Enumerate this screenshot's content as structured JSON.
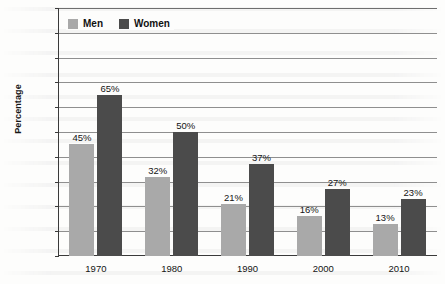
{
  "chart_data": {
    "type": "bar",
    "title": "",
    "xlabel": "",
    "ylabel": "Percentage",
    "ylim": [
      0,
      100
    ],
    "ytick_labels": [
      "100%",
      "90%",
      "80%",
      "70%",
      "60%",
      "50%",
      "40%",
      "30%",
      "20%",
      "10%",
      "0%"
    ],
    "ytick_values": [
      100,
      90,
      80,
      70,
      60,
      50,
      40,
      30,
      20,
      10,
      0
    ],
    "grid": true,
    "legend_position": "top-left-inside",
    "categories": [
      "1970",
      "1980",
      "1990",
      "2000",
      "2010"
    ],
    "series": [
      {
        "name": "Men",
        "color": "#a9a9a9",
        "values": [
          45,
          32,
          21,
          16,
          13
        ],
        "labels": [
          "45%",
          "32%",
          "21%",
          "16%",
          "13%"
        ]
      },
      {
        "name": "Women",
        "color": "#4b4b4b",
        "values": [
          65,
          50,
          37,
          27,
          23
        ],
        "labels": [
          "65%",
          "50%",
          "37%",
          "27%",
          "23%"
        ]
      }
    ]
  }
}
